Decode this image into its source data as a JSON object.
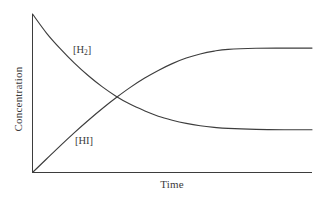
{
  "figure": {
    "background": "#ffffff",
    "line_color": "#3d3d3d",
    "axis_color": "#3d3d3d"
  },
  "axes": {
    "ylabel": "Concentration",
    "xlabel": "Time"
  },
  "labels": {
    "h2_bracket_open": "[H",
    "h2_sub": "2",
    "h2_bracket_close": "]",
    "hi": "[HI]"
  },
  "chart_data": {
    "type": "line",
    "title": "",
    "xlabel": "Time",
    "ylabel": "Concentration",
    "xlim": [
      0,
      1
    ],
    "ylim": [
      0,
      1
    ],
    "grid": false,
    "legend": "inline-annotations",
    "axis_ticks": false,
    "annotations": [
      {
        "text": "[H2]",
        "x": 0.155,
        "y": 0.79,
        "series": "H2"
      },
      {
        "text": "[HI]",
        "x": 0.165,
        "y": 0.235,
        "series": "HI"
      }
    ],
    "series": [
      {
        "name": "[H2]",
        "description": "Reactant concentration decaying exponentially to equilibrium plateau",
        "start_value": 1.0,
        "equilibrium_value": 0.27,
        "x": [
          0.0,
          0.05,
          0.1,
          0.15,
          0.2,
          0.25,
          0.3,
          0.35,
          0.4,
          0.45,
          0.5,
          0.55,
          0.6,
          0.65,
          0.7,
          0.8,
          0.9,
          1.0
        ],
        "y": [
          1.0,
          0.88,
          0.78,
          0.69,
          0.61,
          0.54,
          0.48,
          0.43,
          0.39,
          0.355,
          0.33,
          0.31,
          0.295,
          0.285,
          0.278,
          0.272,
          0.27,
          0.27
        ]
      },
      {
        "name": "[HI]",
        "description": "Product concentration rising to equilibrium plateau",
        "start_value": 0.0,
        "equilibrium_value": 0.785,
        "x": [
          0.0,
          0.05,
          0.1,
          0.15,
          0.2,
          0.25,
          0.3,
          0.35,
          0.4,
          0.45,
          0.5,
          0.55,
          0.6,
          0.65,
          0.7,
          0.8,
          0.9,
          1.0
        ],
        "y": [
          0.0,
          0.085,
          0.17,
          0.252,
          0.33,
          0.404,
          0.473,
          0.537,
          0.594,
          0.644,
          0.687,
          0.722,
          0.748,
          0.766,
          0.777,
          0.784,
          0.785,
          0.785
        ]
      }
    ],
    "crossing_point": {
      "x": 0.268,
      "y": 0.468
    }
  }
}
